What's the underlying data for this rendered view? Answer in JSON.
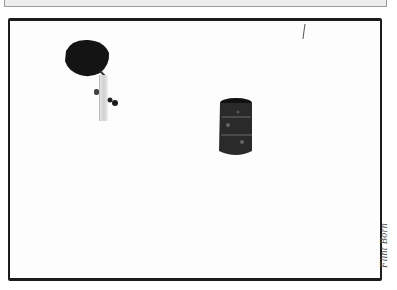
{
  "photo": {
    "subjects": [
      {
        "name": "person-with-umbrella",
        "description": "figure holding black umbrella walking with small dog"
      },
      {
        "name": "oil-drum",
        "description": "dark weathered barrel standing in snow"
      }
    ],
    "scene": "snow field",
    "style": "black and white photograph with thick black border"
  },
  "credit": {
    "text": "Flint Born"
  },
  "colors": {
    "frame": "#1c1c1c",
    "background": "#ffffff",
    "top_panel": "#ededed"
  }
}
